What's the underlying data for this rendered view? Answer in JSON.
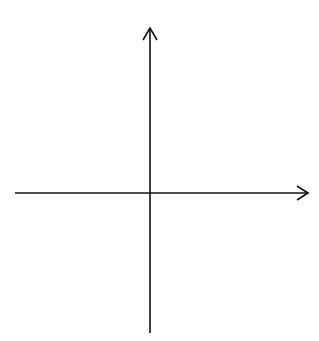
{
  "diagram": {
    "type": "coordinate-plane",
    "x_axis_label": "x",
    "y_axis_label": "y",
    "x_range": [
      -6,
      6
    ],
    "y_range": [
      -6,
      6
    ],
    "grid": "dotted, unit spacing",
    "x_ticks": [
      {
        "value": -5,
        "label": "−5"
      },
      {
        "value": -4,
        "label": "−4"
      },
      {
        "value": -3,
        "label": "−3"
      },
      {
        "value": -2,
        "label": "−2"
      },
      {
        "value": -1,
        "label": "−1"
      },
      {
        "value": 1,
        "label": "1"
      },
      {
        "value": 2,
        "label": "2"
      },
      {
        "value": 3,
        "label": "3"
      },
      {
        "value": 4,
        "label": "4"
      },
      {
        "value": 5,
        "label": "5"
      }
    ],
    "y_ticks": [
      {
        "value": 5,
        "label": "5"
      },
      {
        "value": 4,
        "label": "4"
      },
      {
        "value": 3,
        "label": "3"
      },
      {
        "value": 2,
        "label": "2"
      },
      {
        "value": 1,
        "label": "1"
      },
      {
        "value": -1,
        "label": "−1"
      },
      {
        "value": -2,
        "label": "−2"
      },
      {
        "value": -3,
        "label": "−3"
      },
      {
        "value": -4,
        "label": "−4"
      },
      {
        "value": -5,
        "label": "−5"
      }
    ]
  }
}
